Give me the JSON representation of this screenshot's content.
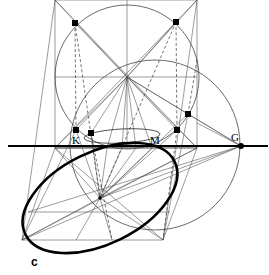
{
  "figure": {
    "caption": "c",
    "background_color": "#ffffff",
    "stroke_color": "#000000",
    "thin_stroke_color": "#4a4a4a",
    "width": 269,
    "height": 275,
    "point_labels": [
      {
        "name": "K",
        "text": "K",
        "x": 72,
        "y": 144
      },
      {
        "name": "M",
        "text": "M",
        "x": 150,
        "y": 144
      },
      {
        "name": "G",
        "text": "G",
        "x": 231,
        "y": 138
      }
    ],
    "markers": [
      {
        "name": "top-left-tangent-point",
        "x": 75,
        "y": 23
      },
      {
        "name": "top-right-tangent-point",
        "x": 176,
        "y": 22
      },
      {
        "name": "left-axis-point-k",
        "x": 76,
        "y": 130
      },
      {
        "name": "left-inner-point",
        "x": 91,
        "y": 133
      },
      {
        "name": "right-inner-point",
        "x": 177,
        "y": 130
      },
      {
        "name": "right-upper-point",
        "x": 188,
        "y": 114
      },
      {
        "name": "g-axis-point",
        "x": 241,
        "y": 146
      },
      {
        "name": "ellipse-center-point",
        "x": 100,
        "y": 198
      }
    ],
    "axis": {
      "name": "horizontal-ground-line",
      "x1": 8,
      "y1": 146,
      "x2": 268,
      "y2": 146
    },
    "upper_rectangle": {
      "x": 55,
      "y": 0,
      "width": 142,
      "height": 148
    },
    "upper_circle": {
      "cx": 127,
      "cy": 77,
      "r": 72
    },
    "right_circle": {
      "cx": 155,
      "cy": 145,
      "r": 85
    },
    "bold_ellipse": {
      "cx": 100,
      "cy": 198,
      "rx": 83,
      "ry": 46,
      "rotation": -26
    },
    "flat_ellipse": {
      "cx": 122,
      "cy": 136,
      "rx": 38,
      "ry": 7,
      "rotation": -3
    },
    "hub_center": {
      "x": 127,
      "y": 77
    },
    "lower_hub_center": {
      "x": 100,
      "y": 198
    }
  }
}
